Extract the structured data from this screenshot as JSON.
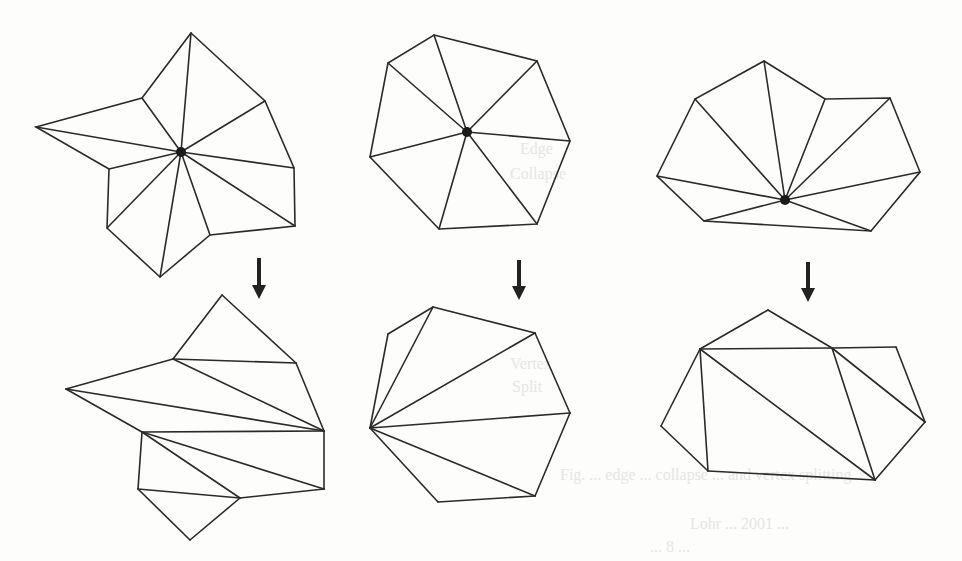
{
  "figure": {
    "stroke_color": "#2a2a2a",
    "dot_color": "#1a1a1a",
    "background": "#fdfdfc",
    "panels": [
      {
        "id": "left",
        "before": {
          "center": [
            181,
            152
          ],
          "polygon": [
            [
              191,
              33
            ],
            [
              265,
              101
            ],
            [
              294,
              168
            ],
            [
              295,
              226
            ],
            [
              210,
              235
            ],
            [
              160,
              277
            ],
            [
              107,
              228
            ],
            [
              109,
              169
            ],
            [
              36,
              127
            ],
            [
              142,
              98
            ]
          ],
          "spokes": [
            [
              191,
              33
            ],
            [
              265,
              101
            ],
            [
              294,
              168
            ],
            [
              295,
              226
            ],
            [
              210,
              235
            ],
            [
              160,
              277
            ],
            [
              107,
              228
            ],
            [
              109,
              169
            ],
            [
              36,
              127
            ],
            [
              142,
              98
            ]
          ]
        },
        "arrow": {
          "x": 259,
          "y1": 258,
          "y2": 299
        },
        "after": {
          "edges": [
            [
              [
                222,
                295
              ],
              [
                173,
                359
              ]
            ],
            [
              [
                222,
                295
              ],
              [
                296,
                363
              ]
            ],
            [
              [
                173,
                359
              ],
              [
                296,
                363
              ]
            ],
            [
              [
                173,
                359
              ],
              [
                66,
                389
              ]
            ],
            [
              [
                173,
                359
              ],
              [
                324,
                431
              ]
            ],
            [
              [
                296,
                363
              ],
              [
                324,
                431
              ]
            ],
            [
              [
                66,
                389
              ],
              [
                324,
                431
              ]
            ],
            [
              [
                66,
                389
              ],
              [
                142,
                432
              ]
            ],
            [
              [
                142,
                432
              ],
              [
                324,
                431
              ]
            ],
            [
              [
                142,
                432
              ],
              [
                138,
                489
              ]
            ],
            [
              [
                142,
                432
              ],
              [
                240,
                498
              ]
            ],
            [
              [
                142,
                432
              ],
              [
                324,
                489
              ]
            ],
            [
              [
                324,
                431
              ],
              [
                324,
                489
              ]
            ],
            [
              [
                138,
                489
              ],
              [
                240,
                498
              ]
            ],
            [
              [
                240,
                498
              ],
              [
                324,
                489
              ]
            ],
            [
              [
                138,
                489
              ],
              [
                190,
                540
              ]
            ],
            [
              [
                190,
                540
              ],
              [
                240,
                498
              ]
            ]
          ]
        }
      },
      {
        "id": "middle",
        "before": {
          "center": [
            467,
            132
          ],
          "polygon": [
            [
              434,
              35
            ],
            [
              537,
              61
            ],
            [
              570,
              141
            ],
            [
              537,
              224
            ],
            [
              439,
              229
            ],
            [
              370,
              157
            ],
            [
              388,
              63
            ]
          ],
          "spokes": [
            [
              434,
              35
            ],
            [
              537,
              61
            ],
            [
              570,
              141
            ],
            [
              537,
              224
            ],
            [
              439,
              229
            ],
            [
              370,
              157
            ],
            [
              388,
              63
            ]
          ]
        },
        "arrow": {
          "x": 519,
          "y1": 260,
          "y2": 300
        },
        "after": {
          "edges": [
            [
              [
                433,
                307
              ],
              [
                535,
                333
              ]
            ],
            [
              [
                535,
                333
              ],
              [
                570,
                413
              ]
            ],
            [
              [
                570,
                413
              ],
              [
                535,
                496
              ]
            ],
            [
              [
                535,
                496
              ],
              [
                438,
                502
              ]
            ],
            [
              [
                438,
                502
              ],
              [
                370,
                428
              ]
            ],
            [
              [
                370,
                428
              ],
              [
                388,
                334
              ]
            ],
            [
              [
                388,
                334
              ],
              [
                433,
                307
              ]
            ],
            [
              [
                370,
                428
              ],
              [
                433,
                307
              ]
            ],
            [
              [
                370,
                428
              ],
              [
                535,
                333
              ]
            ],
            [
              [
                370,
                428
              ],
              [
                570,
                413
              ]
            ],
            [
              [
                370,
                428
              ],
              [
                535,
                496
              ]
            ]
          ]
        }
      },
      {
        "id": "right",
        "before": {
          "center": [
            785,
            200
          ],
          "polygon": [
            [
              764,
              61
            ],
            [
              825,
              99
            ],
            [
              890,
              98
            ],
            [
              920,
              172
            ],
            [
              871,
              231
            ],
            [
              704,
              221
            ],
            [
              657,
              176
            ],
            [
              695,
              99
            ]
          ],
          "spokes": [
            [
              764,
              61
            ],
            [
              825,
              99
            ],
            [
              890,
              98
            ],
            [
              920,
              172
            ],
            [
              871,
              231
            ],
            [
              704,
              221
            ],
            [
              657,
              176
            ],
            [
              695,
              99
            ]
          ]
        },
        "arrow": {
          "x": 808,
          "y1": 262,
          "y2": 302
        },
        "after": {
          "edges": [
            [
              [
                768,
                310
              ],
              [
                700,
                349
              ]
            ],
            [
              [
                768,
                310
              ],
              [
                832,
                348
              ]
            ],
            [
              [
                700,
                349
              ],
              [
                832,
                348
              ]
            ],
            [
              [
                832,
                348
              ],
              [
                896,
                347
              ]
            ],
            [
              [
                896,
                347
              ],
              [
                925,
                422
              ]
            ],
            [
              [
                925,
                422
              ],
              [
                875,
                480
              ]
            ],
            [
              [
                875,
                480
              ],
              [
                708,
                471
              ]
            ],
            [
              [
                708,
                471
              ],
              [
                661,
                426
              ]
            ],
            [
              [
                661,
                426
              ],
              [
                700,
                349
              ]
            ],
            [
              [
                700,
                349
              ],
              [
                708,
                471
              ]
            ],
            [
              [
                700,
                349
              ],
              [
                875,
                480
              ]
            ],
            [
              [
                832,
                348
              ],
              [
                875,
                480
              ]
            ],
            [
              [
                832,
                348
              ],
              [
                925,
                422
              ]
            ]
          ]
        }
      }
    ]
  },
  "show_through_text": [
    {
      "text": "Edge",
      "x": 520,
      "y": 140
    },
    {
      "text": "Collapse",
      "x": 510,
      "y": 165
    },
    {
      "text": "Vertex",
      "x": 510,
      "y": 355
    },
    {
      "text": "Split",
      "x": 512,
      "y": 378
    },
    {
      "text": "Fig. ... edge ... collapse ... and vertex splitting",
      "x": 560,
      "y": 466
    },
    {
      "text": "Lohr ... 2001 ...",
      "x": 690,
      "y": 515
    },
    {
      "text": "... 8 ...",
      "x": 650,
      "y": 538
    }
  ]
}
